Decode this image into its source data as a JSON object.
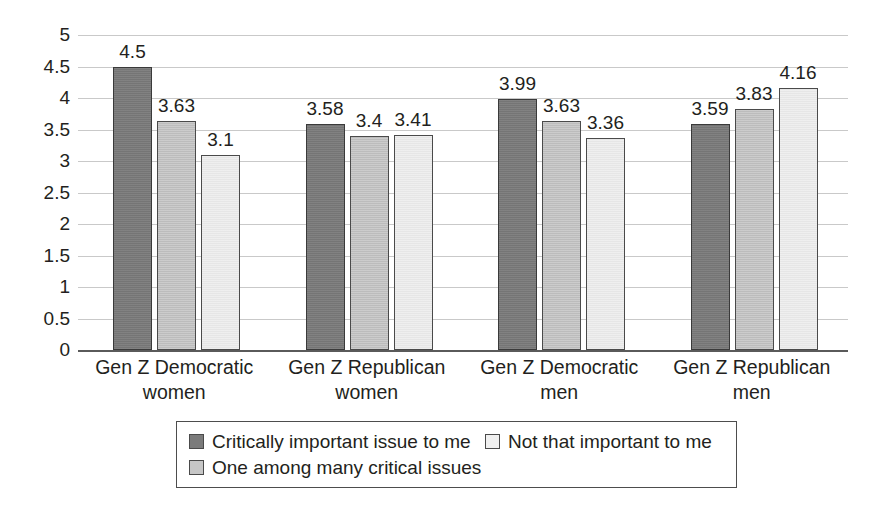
{
  "chart_data": {
    "type": "bar",
    "title": "",
    "xlabel": "",
    "ylabel": "",
    "ylim": [
      0,
      5
    ],
    "ytick_values": [
      5,
      4.5,
      4,
      3.5,
      3,
      2.5,
      2,
      1.5,
      1,
      0.5,
      0
    ],
    "ytick_labels": [
      "5",
      "4.5",
      "4",
      "3.5",
      "3",
      "2.5",
      "2",
      "1.5",
      "1",
      "0.5",
      "0"
    ],
    "grid": true,
    "legend_position": "bottom",
    "categories": [
      "Gen Z Democratic women",
      "Gen Z Republican women",
      "Gen Z Democratic men",
      "Gen Z Republican men"
    ],
    "category_lines": [
      [
        "Gen Z Democratic",
        "women"
      ],
      [
        "Gen Z Republican",
        "women"
      ],
      [
        "Gen Z Democratic",
        "men"
      ],
      [
        "Gen Z Republican",
        "men"
      ]
    ],
    "series": [
      {
        "name": "Critically important issue to me",
        "color": "#7b7b7b",
        "values": [
          4.5,
          3.58,
          3.99,
          3.59
        ],
        "labels": [
          "4.5",
          "3.58",
          "3.99",
          "3.59"
        ]
      },
      {
        "name": "One among many critical issues",
        "color": "#c6c6c6",
        "values": [
          3.63,
          3.4,
          3.63,
          3.83
        ],
        "labels": [
          "3.63",
          "3.4",
          "3.63",
          "3.83"
        ]
      },
      {
        "name": "Not that important to me",
        "color": "#ededed",
        "values": [
          3.1,
          3.41,
          3.36,
          4.16
        ],
        "labels": [
          "3.1",
          "3.41",
          "3.36",
          "4.16"
        ]
      }
    ]
  },
  "legend": {
    "entries": [
      {
        "label": "Critically important issue to me",
        "swatch": "legend-swatch-dark"
      },
      {
        "label": "One among many critical issues",
        "swatch": "legend-swatch-medium"
      },
      {
        "label": "Not that important to me",
        "swatch": "legend-swatch-light"
      }
    ]
  }
}
